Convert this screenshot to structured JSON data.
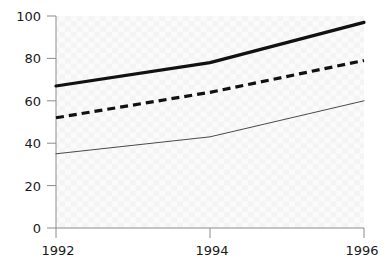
{
  "chart_data": {
    "type": "line",
    "title": "",
    "subtitle": "",
    "xlabel": "",
    "ylabel": "",
    "x": [
      1992,
      1994,
      1996
    ],
    "x_tick_labels": [
      "1992",
      "1994",
      "1996"
    ],
    "xlim": [
      1992,
      1996
    ],
    "y_tick_labels": [
      "0",
      "20",
      "40",
      "60",
      "80",
      "100"
    ],
    "y_ticks": [
      0,
      20,
      40,
      60,
      80,
      100
    ],
    "ylim": [
      0,
      100
    ],
    "grid": true,
    "grid_style": "faint-checker",
    "legend": "none",
    "series": [
      {
        "name": "series-thick-solid",
        "style": "solid",
        "line_width": 3.2,
        "color": "#111111",
        "values": [
          67,
          78,
          97
        ]
      },
      {
        "name": "series-dashed",
        "style": "dashed",
        "line_width": 3.2,
        "color": "#111111",
        "values": [
          52,
          64,
          79
        ]
      },
      {
        "name": "series-thin-solid",
        "style": "solid",
        "line_width": 1,
        "color": "#4a4a4a",
        "values": [
          35,
          43,
          60
        ]
      }
    ]
  },
  "axes": {
    "axis_color": "#8c8c8c",
    "plot_bg": "#fafafa",
    "grid_color": "#f2f2f2",
    "tick_text_color": "#1a1a1a"
  },
  "y_axis": {
    "labels": [
      "100",
      "80",
      "60",
      "40",
      "20",
      "0"
    ]
  },
  "x_axis": {
    "labels": [
      "1992",
      "1994",
      "1996"
    ]
  }
}
